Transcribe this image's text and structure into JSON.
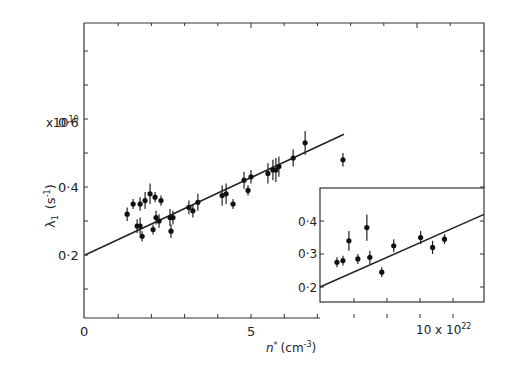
{
  "chart_data": {
    "type": "scatter",
    "title": "",
    "xlabel": "n* (cm^-3)",
    "ylabel": "λ1 (s^-1)",
    "y_multiplier": "x10^10",
    "x_multiplier": "x10^22",
    "xlim": [
      0,
      12
    ],
    "ylim": [
      0,
      0.8
    ],
    "x_ticks": [
      {
        "v": 0,
        "label": "0"
      },
      {
        "v": 5,
        "label": "5"
      },
      {
        "v": 10,
        "label": "10 x 10^22"
      }
    ],
    "y_ticks": [
      {
        "v": 0.2,
        "label": "0·2"
      },
      {
        "v": 0.4,
        "label": "0·4"
      },
      {
        "v": 0.6,
        "label": "0·6"
      }
    ],
    "grid": false,
    "series": [
      {
        "name": "main",
        "points": [
          [
            1.27,
            0.32,
            0.02
          ],
          [
            1.45,
            0.35,
            0.015
          ],
          [
            1.66,
            0.35,
            0.02
          ],
          [
            1.81,
            0.36,
            0.025
          ],
          [
            1.96,
            0.38,
            0.03
          ],
          [
            2.11,
            0.37,
            0.015
          ],
          [
            2.29,
            0.36,
            0.015
          ],
          [
            1.57,
            0.285,
            0.02
          ],
          [
            1.66,
            0.285,
            0.025
          ],
          [
            1.72,
            0.255,
            0.015
          ],
          [
            2.05,
            0.275,
            0.015
          ],
          [
            2.14,
            0.31,
            0.02
          ],
          [
            2.23,
            0.3,
            0.02
          ],
          [
            2.56,
            0.31,
            0.025
          ],
          [
            2.65,
            0.31,
            0.02
          ],
          [
            2.59,
            0.27,
            0.02
          ],
          [
            3.13,
            0.34,
            0.02
          ],
          [
            3.25,
            0.33,
            0.02
          ],
          [
            3.4,
            0.355,
            0.025
          ],
          [
            4.13,
            0.375,
            0.03
          ],
          [
            4.25,
            0.38,
            0.03
          ],
          [
            4.46,
            0.35,
            0.015
          ],
          [
            4.79,
            0.42,
            0.025
          ],
          [
            4.91,
            0.39,
            0.015
          ],
          [
            5.0,
            0.43,
            0.02
          ],
          [
            5.51,
            0.44,
            0.03
          ],
          [
            5.66,
            0.45,
            0.03
          ],
          [
            5.75,
            0.45,
            0.035
          ],
          [
            5.84,
            0.46,
            0.03
          ],
          [
            6.27,
            0.485,
            0.025
          ],
          [
            6.63,
            0.53,
            0.035
          ],
          [
            7.77,
            0.48,
            0.02
          ]
        ]
      },
      {
        "name": "inset",
        "points": [
          [
            7.3,
            0.275,
            0.015
          ],
          [
            7.5,
            0.28,
            0.015
          ],
          [
            7.7,
            0.34,
            0.03
          ],
          [
            8.0,
            0.285,
            0.015
          ],
          [
            8.3,
            0.38,
            0.04
          ],
          [
            8.4,
            0.29,
            0.02
          ],
          [
            8.8,
            0.245,
            0.015
          ],
          [
            9.2,
            0.325,
            0.02
          ],
          [
            10.1,
            0.35,
            0.02
          ],
          [
            10.5,
            0.32,
            0.02
          ],
          [
            10.9,
            0.345,
            0.015
          ]
        ]
      }
    ],
    "fit_line": {
      "x": [
        0,
        7.8
      ],
      "y": [
        0.2,
        0.555
      ]
    },
    "inset": {
      "y_ticks": [
        {
          "v": 0.2,
          "label": "0·2"
        },
        {
          "v": 0.3,
          "label": "0·3"
        },
        {
          "v": 0.4,
          "label": "0·4"
        }
      ],
      "fit_line": {
        "y_at_left": 0.2,
        "y_at_right": 0.42
      }
    }
  },
  "labels": {
    "y_mult": "x10",
    "y_mult_exp": "10",
    "ylabel_main": "λ",
    "ylabel_sub": "1",
    "ylabel_unit": "(s",
    "ylabel_unit_exp": "-1",
    "ylabel_unit_close": ")",
    "xlabel_main": "n",
    "xlabel_star": "*",
    "xlabel_unit": "(cm",
    "xlabel_unit_exp": "-3",
    "xlabel_unit_close": ")",
    "x_tick_0": "0",
    "x_tick_5": "5",
    "x_tick_10": "10 x 10",
    "x_tick_10_exp": "22",
    "y_tick_02": "0·2",
    "y_tick_04": "0·4",
    "y_tick_06": "0·6",
    "inset_y_04": "0·4",
    "inset_y_03": "0·3",
    "inset_y_02": "0·2"
  }
}
